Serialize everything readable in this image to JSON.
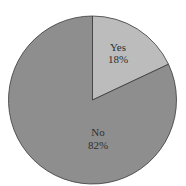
{
  "chart_data": {
    "type": "pie",
    "title": "",
    "categories": [
      "Yes",
      "No"
    ],
    "values": [
      18,
      82
    ],
    "labels": [
      {
        "name": "Yes",
        "percent": "18%"
      },
      {
        "name": "No",
        "percent": "82%"
      }
    ],
    "colors": {
      "Yes": "#bcbcbc",
      "No": "#8e8e8e"
    },
    "start_angle_deg": 90,
    "direction": "clockwise",
    "legend": "none"
  },
  "text": {
    "yes_name": "Yes",
    "yes_pct": "18%",
    "no_name": "No",
    "no_pct": "82%"
  }
}
